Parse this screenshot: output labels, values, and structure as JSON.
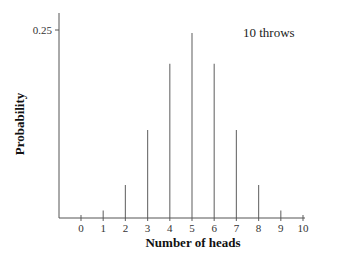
{
  "chart_data": {
    "type": "bar",
    "title": "",
    "annotation": "10 throws",
    "xlabel": "Number of heads",
    "ylabel": "Probability",
    "categories": [
      "0",
      "1",
      "2",
      "3",
      "4",
      "5",
      "6",
      "7",
      "8",
      "9",
      "10"
    ],
    "values": [
      0.001,
      0.01,
      0.044,
      0.117,
      0.205,
      0.246,
      0.205,
      0.117,
      0.044,
      0.01,
      0.001
    ],
    "yticks": [
      "0.25"
    ],
    "ylim": [
      0,
      0.27
    ],
    "grid": false,
    "legend": "none"
  },
  "colors": {
    "bar": "#777777",
    "axis": "#555555"
  }
}
